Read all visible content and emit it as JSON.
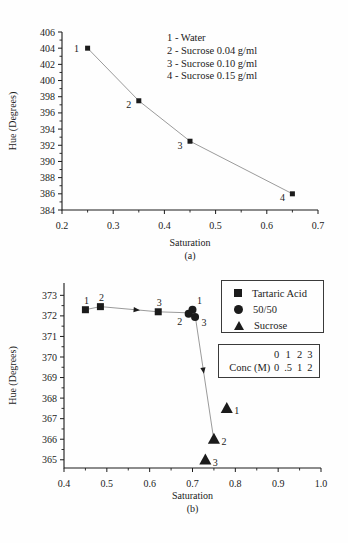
{
  "figure": {
    "ink_color": "#1b1b1b",
    "line_color": "#8f8f8f",
    "background": "#fefefe"
  },
  "chart_data": [
    {
      "type": "line",
      "panel_label": "(a)",
      "xlabel": "Saturation",
      "ylabel": "Hue (Degrees)",
      "xaxis": {
        "min": 0.2,
        "max": 0.7,
        "tick_step": 0.1,
        "minor_step": 0.05,
        "decimals": 1
      },
      "yaxis": {
        "min": 384,
        "max": 406,
        "tick_step": 2,
        "minor_step": 1,
        "decimals": 0,
        "draw_min": 384,
        "draw_max": 406
      },
      "series": [
        {
          "name": "sucrose-water-curve",
          "marker": "square",
          "marker_size": 5,
          "line": true,
          "points": [
            {
              "x": 0.25,
              "y": 404,
              "label": "1",
              "dx": -11,
              "dy": 0
            },
            {
              "x": 0.35,
              "y": 397.5,
              "label": "2",
              "dx": -10,
              "dy": 4
            },
            {
              "x": 0.45,
              "y": 392.5,
              "label": "3",
              "dx": -10,
              "dy": 4
            },
            {
              "x": 0.65,
              "y": 386,
              "label": "4",
              "dx": -10,
              "dy": 4
            }
          ]
        }
      ],
      "annotation_lines": [
        "1 - Water",
        "2 - Sucrose 0.04 g/ml",
        "3 - Sucrose 0.10 g/ml",
        "4 - Sucrose 0.15 g/ml"
      ]
    },
    {
      "type": "scatter",
      "panel_label": "(b)",
      "xlabel": "Saturation",
      "ylabel": "Hue (Degrees)",
      "xaxis": {
        "min": 0.4,
        "max": 1.0,
        "tick_step": 0.1,
        "minor_step": 0.05,
        "decimals": 1
      },
      "yaxis": {
        "min": 365,
        "max": 373,
        "tick_step": 1,
        "minor_step": 0.5,
        "decimals": 0,
        "draw_min": 364.6,
        "draw_max": 373.6
      },
      "series": [
        {
          "name": "tartaric-acid",
          "marker": "square",
          "marker_size": 7,
          "line": false,
          "points": [
            {
              "x": 0.45,
              "y": 372.3,
              "label": "1",
              "dx": 1,
              "dy": -9
            },
            {
              "x": 0.485,
              "y": 372.45,
              "label": "2",
              "dx": 1,
              "dy": -9
            },
            {
              "x": 0.62,
              "y": 372.2,
              "label": "3",
              "dx": 1,
              "dy": -9
            }
          ]
        },
        {
          "name": "fifty-fifty",
          "marker": "circle",
          "marker_size": 8,
          "line": false,
          "points": [
            {
              "x": 0.7,
              "y": 372.3,
              "label": "1",
              "dx": 7,
              "dy": -9
            },
            {
              "x": 0.691,
              "y": 372.1,
              "label": "2",
              "dx": -9,
              "dy": 8
            },
            {
              "x": 0.706,
              "y": 371.95,
              "label": "3",
              "dx": 9,
              "dy": 6
            }
          ]
        },
        {
          "name": "sucrose",
          "marker": "triangle",
          "marker_size": 11,
          "line": false,
          "points": [
            {
              "x": 0.78,
              "y": 367.5,
              "label": "1",
              "dx": 10,
              "dy": 2
            },
            {
              "x": 0.75,
              "y": 366.0,
              "label": "2",
              "dx": 10,
              "dy": 2
            },
            {
              "x": 0.73,
              "y": 365.0,
              "label": "3",
              "dx": 10,
              "dy": 3
            }
          ]
        }
      ],
      "connectors": [
        {
          "points": [
            [
              0.45,
              372.3
            ],
            [
              0.485,
              372.45
            ],
            [
              0.62,
              372.2
            ],
            [
              0.69,
              372.15
            ]
          ],
          "arrow": {
            "seg": 1,
            "t": 0.63
          }
        },
        {
          "points": [
            [
              0.707,
              371.9
            ],
            [
              0.748,
              366.2
            ]
          ],
          "arrow": {
            "seg": 0,
            "t": 0.45
          }
        }
      ],
      "legend": {
        "items": [
          {
            "marker": "square",
            "label": "Tartaric Acid"
          },
          {
            "marker": "circle",
            "label": "50/50"
          },
          {
            "marker": "triangle",
            "label": "Sucrose"
          }
        ]
      },
      "conc_table": {
        "label": "Conc (M)",
        "point_numbers": [
          "0",
          "1",
          "2",
          "3"
        ],
        "concentrations": [
          "0",
          ".5",
          "1",
          "2"
        ]
      }
    }
  ]
}
